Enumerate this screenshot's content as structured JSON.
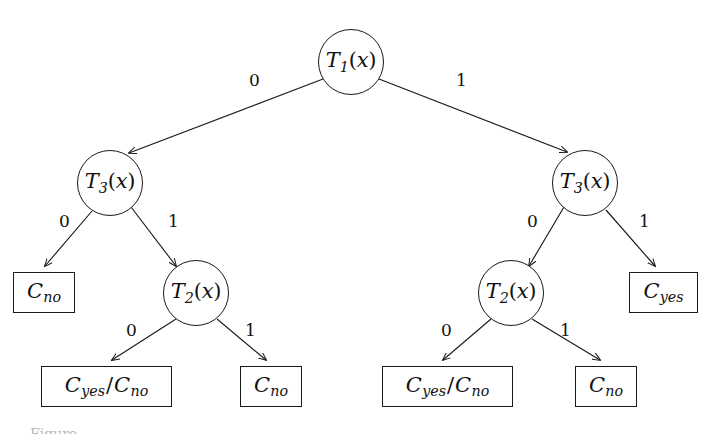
{
  "figure": {
    "type": "binary-decision-tree",
    "caption_fragment": "Figure",
    "stroke_color": "#1a1a1a",
    "text_color": "#111111",
    "background_color": "#ffffff"
  },
  "nodes": [
    {
      "id": "root",
      "kind": "decision",
      "symbol": "T",
      "subscript": "1",
      "arg": "x",
      "label": "T1(x)",
      "cx": 351,
      "cy": 62,
      "r": 33
    },
    {
      "id": "l",
      "kind": "decision",
      "symbol": "T",
      "subscript": "3",
      "arg": "x",
      "label": "T3(x)",
      "cx": 110,
      "cy": 183,
      "r": 33
    },
    {
      "id": "r",
      "kind": "decision",
      "symbol": "T",
      "subscript": "3",
      "arg": "x",
      "label": "T3(x)",
      "cx": 585,
      "cy": 183,
      "r": 33
    },
    {
      "id": "l1",
      "kind": "decision",
      "symbol": "T",
      "subscript": "2",
      "arg": "x",
      "label": "T2(x)",
      "cx": 196,
      "cy": 293,
      "r": 33
    },
    {
      "id": "r0",
      "kind": "decision",
      "symbol": "T",
      "subscript": "2",
      "arg": "x",
      "label": "T2(x)",
      "cx": 511,
      "cy": 293,
      "r": 33
    }
  ],
  "leaves": [
    {
      "id": "leaf-l0",
      "label": "Cno",
      "classes": [
        "no"
      ],
      "x": 13,
      "y": 272,
      "w": 62,
      "h": 41
    },
    {
      "id": "leaf-r1",
      "label": "Cyes",
      "classes": [
        "yes"
      ],
      "x": 629,
      "y": 272,
      "w": 69,
      "h": 41
    },
    {
      "id": "leaf-l10",
      "label": "Cyes/Cno",
      "classes": [
        "yes",
        "no"
      ],
      "x": 41,
      "y": 366,
      "w": 131,
      "h": 41
    },
    {
      "id": "leaf-l11",
      "label": "Cno",
      "classes": [
        "no"
      ],
      "x": 240,
      "y": 366,
      "w": 62,
      "h": 41
    },
    {
      "id": "leaf-r00",
      "label": "Cyes/Cno",
      "classes": [
        "yes",
        "no"
      ],
      "x": 382,
      "y": 366,
      "w": 131,
      "h": 41
    },
    {
      "id": "leaf-r01",
      "label": "Cno",
      "classes": [
        "no"
      ],
      "x": 575,
      "y": 366,
      "w": 62,
      "h": 41
    }
  ],
  "edges": [
    {
      "id": "root-left",
      "from": "root",
      "to": "l",
      "label": "0",
      "label_x": 249,
      "label_y": 72
    },
    {
      "id": "root-right",
      "from": "root",
      "to": "r",
      "label": "1",
      "label_x": 456,
      "label_y": 72
    },
    {
      "id": "l-left",
      "from": "l",
      "to": "leaf-l0",
      "label": "0",
      "label_x": 59,
      "label_y": 213
    },
    {
      "id": "l-right",
      "from": "l",
      "to": "l1",
      "label": "1",
      "label_x": 168,
      "label_y": 213
    },
    {
      "id": "r-left",
      "from": "r",
      "to": "r0",
      "label": "0",
      "label_x": 527,
      "label_y": 213
    },
    {
      "id": "r-right",
      "from": "r",
      "to": "leaf-r1",
      "label": "1",
      "label_x": 639,
      "label_y": 213
    },
    {
      "id": "l1-left",
      "from": "l1",
      "to": "leaf-l10",
      "label": "0",
      "label_x": 126,
      "label_y": 322
    },
    {
      "id": "l1-right",
      "from": "l1",
      "to": "leaf-l11",
      "label": "1",
      "label_x": 245,
      "label_y": 322
    },
    {
      "id": "r0-left",
      "from": "r0",
      "to": "leaf-r00",
      "label": "0",
      "label_x": 441,
      "label_y": 322
    },
    {
      "id": "r0-right",
      "from": "r0",
      "to": "leaf-r01",
      "label": "1",
      "label_x": 560,
      "label_y": 322
    }
  ],
  "tree_logic": {
    "root_test": "T1(x)",
    "branch_0": {
      "test": "T3(x)",
      "on_0": "Cno",
      "on_1": {
        "test": "T2(x)",
        "on_0": "Cyes/Cno",
        "on_1": "Cno"
      }
    },
    "branch_1": {
      "test": "T3(x)",
      "on_0": {
        "test": "T2(x)",
        "on_0": "Cyes/Cno",
        "on_1": "Cno"
      },
      "on_1": "Cyes"
    }
  }
}
